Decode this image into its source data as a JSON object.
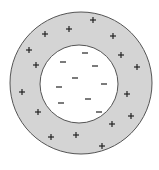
{
  "diagram": {
    "title": "",
    "colors": {
      "background": "#ffffff",
      "shell_fill": "#d4d4d4",
      "core_fill": "#ffffff",
      "outline": "#555555",
      "symbol": "#222222"
    },
    "outer_circle": {
      "cx": 81,
      "cy": 83,
      "r": 71,
      "label": "charged outer shell"
    },
    "inner_circle": {
      "cx": 79,
      "cy": 84,
      "r": 39,
      "label": "inner region"
    },
    "positive_charges": {
      "symbol": "+",
      "count": 16,
      "points": [
        [
          93,
          20
        ],
        [
          69,
          29
        ],
        [
          113,
          36
        ],
        [
          45,
          34
        ],
        [
          29,
          50
        ],
        [
          121,
          55
        ],
        [
          36,
          65
        ],
        [
          137,
          67
        ],
        [
          22,
          92
        ],
        [
          127,
          94
        ],
        [
          38,
          112
        ],
        [
          131,
          116
        ],
        [
          112,
          124
        ],
        [
          76,
          135
        ],
        [
          51,
          137
        ],
        [
          102,
          146
        ]
      ]
    },
    "negative_charges": {
      "symbol": "−",
      "count": 9,
      "points": [
        [
          85,
          53
        ],
        [
          63,
          62
        ],
        [
          95,
          66
        ],
        [
          75,
          78
        ],
        [
          104,
          84
        ],
        [
          59,
          87
        ],
        [
          88,
          99
        ],
        [
          61,
          103
        ],
        [
          99,
          112
        ]
      ]
    }
  }
}
